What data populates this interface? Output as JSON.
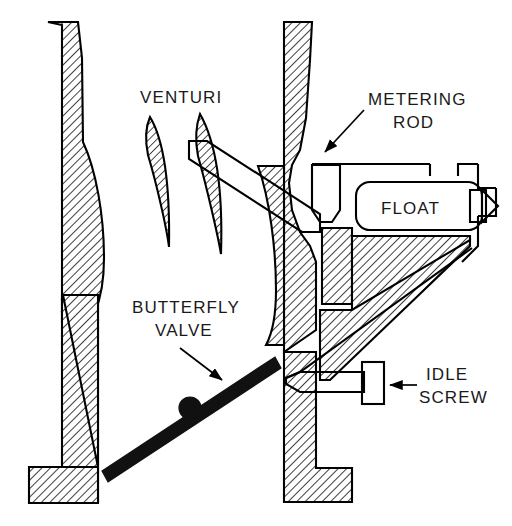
{
  "diagram": {
    "type": "technical-cross-section",
    "background_color": "#ffffff",
    "line_color": "#000000",
    "hatch_color": "#000000",
    "labels": [
      {
        "id": "venturi",
        "text": "VENTURI",
        "x": 140,
        "y": 103
      },
      {
        "id": "metering",
        "text": "METERING",
        "x": 368,
        "y": 105
      },
      {
        "id": "rod",
        "text": "ROD",
        "x": 393,
        "y": 128
      },
      {
        "id": "float",
        "text": "FLOAT",
        "x": 381,
        "y": 207
      },
      {
        "id": "butterfly",
        "text": "BUTTERFLY",
        "x": 132,
        "y": 313
      },
      {
        "id": "valve",
        "text": "VALVE",
        "x": 152,
        "y": 336
      },
      {
        "id": "idle",
        "text": "IDLE",
        "x": 426,
        "y": 380
      },
      {
        "id": "screw",
        "text": "SCREW",
        "x": 420,
        "y": 403
      }
    ],
    "parts": [
      {
        "name": "left-throat-wall",
        "style": "hatched"
      },
      {
        "name": "left-base-foot",
        "style": "hatched"
      },
      {
        "name": "venturi-blade-left",
        "style": "hatched"
      },
      {
        "name": "venturi-blade-right",
        "style": "hatched"
      },
      {
        "name": "center-column",
        "style": "hatched"
      },
      {
        "name": "nozzle-tube",
        "style": "outline"
      },
      {
        "name": "metering-rod-well",
        "style": "outline"
      },
      {
        "name": "float-chamber",
        "style": "outline"
      },
      {
        "name": "needle-valve",
        "style": "outline"
      },
      {
        "name": "fuel-bowl-wall",
        "style": "hatched"
      },
      {
        "name": "center-base-foot",
        "style": "hatched"
      },
      {
        "name": "butterfly-valve-plate",
        "style": "solid"
      },
      {
        "name": "idle-screw",
        "style": "outline"
      }
    ],
    "annotations": [
      {
        "name": "metering-rod-leader",
        "from": [
          362,
          110
        ],
        "to": [
          322,
          155
        ],
        "arrow": true
      },
      {
        "name": "butterfly-valve-leader",
        "from": [
          182,
          348
        ],
        "to": [
          226,
          382
        ],
        "arrow": true
      },
      {
        "name": "idle-screw-leader",
        "from": [
          417,
          388
        ],
        "to": [
          378,
          388
        ],
        "arrow": true
      }
    ]
  }
}
